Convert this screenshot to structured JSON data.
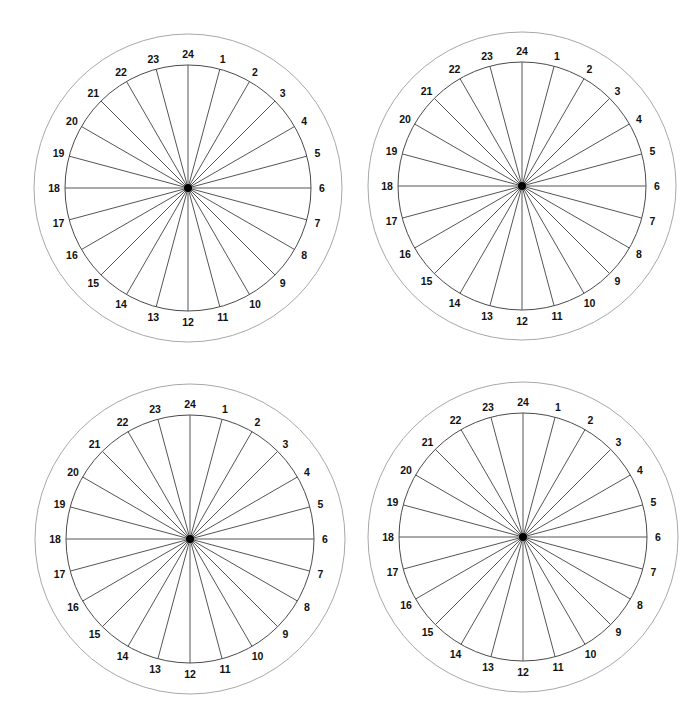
{
  "diagram": {
    "type": "24-hour-clock-wheel",
    "colors": {
      "background": "#ffffff",
      "outer_ring": "#a8a8a8",
      "inner_ring": "#4a4a4a",
      "spokes": "#555555",
      "labels": "#111111",
      "hub": "#000000"
    },
    "divisions": 24,
    "hour_labels": [
      "1",
      "2",
      "3",
      "4",
      "5",
      "6",
      "7",
      "8",
      "9",
      "10",
      "11",
      "12",
      "13",
      "14",
      "15",
      "16",
      "17",
      "18",
      "19",
      "20",
      "21",
      "22",
      "23",
      "24"
    ],
    "wheels": [
      {
        "name": "wheel-top-left",
        "cx": 188,
        "cy": 188,
        "outer_r": 154,
        "inner_r": 123,
        "label_r": 134
      },
      {
        "name": "wheel-top-right",
        "cx": 522,
        "cy": 186,
        "outer_r": 154,
        "inner_r": 124,
        "label_r": 135
      },
      {
        "name": "wheel-bottom-left",
        "cx": 190,
        "cy": 539,
        "outer_r": 155,
        "inner_r": 124,
        "label_r": 135
      },
      {
        "name": "wheel-bottom-right",
        "cx": 523,
        "cy": 537,
        "outer_r": 155,
        "inner_r": 124,
        "label_r": 135
      }
    ]
  }
}
